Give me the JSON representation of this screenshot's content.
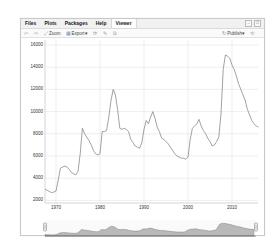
{
  "tabs": [
    {
      "label": "Files",
      "active": false
    },
    {
      "label": "Plots",
      "active": false
    },
    {
      "label": "Packages",
      "active": false
    },
    {
      "label": "Help",
      "active": false
    },
    {
      "label": "Viewer",
      "active": true
    }
  ],
  "window_controls": {
    "minimize": "–",
    "maximize": "□"
  },
  "toolbar": {
    "back_icon": "⇦",
    "forward_icon": "⇨",
    "zoom_label": "Zoom",
    "export_label": "Export",
    "export_caret": "▾",
    "refresh_icon": "⟳",
    "brush_icon": "✎",
    "popout_icon": "⧉",
    "publish_label": "Publish",
    "publish_caret": "▾",
    "refresh2_icon": "⟲"
  },
  "colors": {
    "line": "#7a7a7a",
    "grid": "#e3e3e3",
    "range_fill": "#b9b9b9",
    "range_line": "#808080"
  },
  "chart_data": {
    "type": "line",
    "title": "",
    "xlabel": "",
    "ylabel": "",
    "grid": true,
    "legend": null,
    "xlim": [
      1967.5,
      2016.5
    ],
    "ylim": [
      1500,
      16500
    ],
    "x_ticks": [
      1970,
      1980,
      1990,
      2000,
      2010
    ],
    "y_ticks": [
      2000,
      4000,
      6000,
      8000,
      10000,
      12000,
      14000,
      16000
    ],
    "range_selector": true,
    "series": [
      {
        "name": "series",
        "x": [
          1967.5,
          1968.0,
          1968.5,
          1969.0,
          1969.5,
          1970.0,
          1970.5,
          1971.0,
          1971.5,
          1972.0,
          1972.5,
          1973.0,
          1973.5,
          1974.0,
          1974.5,
          1975.0,
          1975.5,
          1976.0,
          1976.5,
          1977.0,
          1977.5,
          1978.0,
          1978.5,
          1979.0,
          1979.5,
          1980.0,
          1980.5,
          1981.0,
          1981.5,
          1982.0,
          1982.5,
          1983.0,
          1983.5,
          1984.0,
          1984.5,
          1985.0,
          1985.5,
          1986.0,
          1986.5,
          1987.0,
          1987.5,
          1988.0,
          1988.5,
          1989.0,
          1989.5,
          1990.0,
          1990.5,
          1991.0,
          1991.5,
          1992.0,
          1992.5,
          1993.0,
          1993.5,
          1994.0,
          1994.5,
          1995.0,
          1995.5,
          1996.0,
          1996.5,
          1997.0,
          1997.5,
          1998.0,
          1998.5,
          1999.0,
          1999.5,
          2000.0,
          2000.5,
          2001.0,
          2001.5,
          2002.0,
          2002.5,
          2003.0,
          2003.5,
          2004.0,
          2004.5,
          2005.0,
          2005.5,
          2006.0,
          2006.5,
          2007.0,
          2007.5,
          2008.0,
          2008.5,
          2009.0,
          2009.5,
          2010.0,
          2010.5,
          2011.0,
          2011.5,
          2012.0,
          2012.5,
          2013.0,
          2013.5,
          2014.0,
          2014.5,
          2015.0,
          2015.5,
          2016.0
        ],
        "values": [
          3000,
          2900,
          2800,
          2700,
          2750,
          2850,
          3800,
          4900,
          5000,
          5100,
          5000,
          4800,
          4500,
          4400,
          4300,
          4600,
          6200,
          8500,
          8000,
          7700,
          7400,
          7000,
          6500,
          6200,
          6100,
          6200,
          8200,
          8200,
          8300,
          9500,
          11000,
          12000,
          11500,
          10200,
          8500,
          8400,
          8500,
          8400,
          8200,
          7500,
          7200,
          6900,
          6800,
          6700,
          7200,
          8400,
          9200,
          8900,
          9500,
          10000,
          9400,
          8600,
          8200,
          7600,
          7500,
          7300,
          7100,
          6800,
          6500,
          6200,
          6000,
          5900,
          5800,
          5800,
          5700,
          5900,
          7500,
          8500,
          8700,
          8900,
          9300,
          8700,
          8300,
          8000,
          7600,
          7300,
          6900,
          7000,
          7300,
          7700,
          9800,
          13800,
          15100,
          15000,
          14800,
          14200,
          13800,
          13200,
          12500,
          12000,
          11500,
          11000,
          10200,
          9700,
          9200,
          8900,
          8700,
          8600
        ]
      }
    ]
  }
}
